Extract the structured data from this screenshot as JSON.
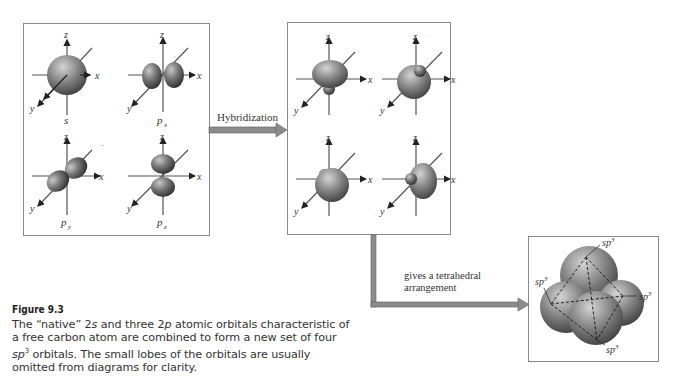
{
  "figure": {
    "number_label": "Figure 9.3",
    "caption_parts": {
      "pre": "The “native” 2",
      "s": "s",
      "mid1": " and three 2",
      "p": "p",
      "mid2": " atomic orbitals characteristic of a free carbon atom are combined to form a new set of four ",
      "sp": "sp",
      "sup": "3",
      "post": " orbitals. The small lobes of the orbitals are usually omitted from diagrams for clarity."
    }
  },
  "panels": {
    "atomic": {
      "orbitals": [
        {
          "id": "s",
          "label": "s",
          "sub": ""
        },
        {
          "id": "px",
          "label": "p",
          "sub": "x"
        },
        {
          "id": "py",
          "label": "p",
          "sub": "y"
        },
        {
          "id": "pz",
          "label": "p",
          "sub": "z"
        }
      ]
    },
    "hybrid": {
      "orbitals": [
        {
          "id": "sp3-1"
        },
        {
          "id": "sp3-2"
        },
        {
          "id": "sp3-3"
        },
        {
          "id": "sp3-4"
        }
      ]
    },
    "tetrahedral": {
      "labels": [
        "sp",
        "sp",
        "sp",
        "sp"
      ],
      "superscript": "3"
    }
  },
  "axes": {
    "x": "x",
    "y": "y",
    "z": "z"
  },
  "arrows": {
    "hybridization": {
      "label": "Hybridization"
    },
    "tetrahedral": {
      "label_line1": "gives a tetrahedral",
      "label_line2": "arrangement"
    }
  },
  "colors": {
    "arrow_fill": "#8c8c8c",
    "arrow_edge": "#5e5e5e",
    "box_border": "#8a8a8a",
    "lobe_dark": "#3a3a3a",
    "lobe_light": "#9a9a9a"
  }
}
